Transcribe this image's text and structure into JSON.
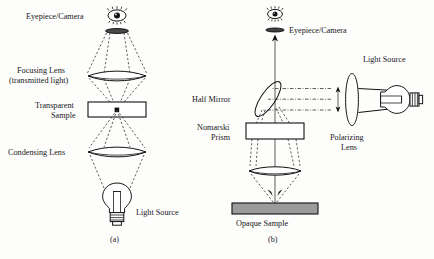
{
  "figure": {
    "panels": [
      {
        "id": "a",
        "caption": "(a)",
        "name": "transmitted-light-microscope",
        "labels": {
          "eyepiece": "Eyepiece/Camera",
          "focusing_lens_line1": "Focusing Lens",
          "focusing_lens_line2": "(transmitted light)",
          "sample_line1": "Transparent",
          "sample_line2": "Sample",
          "condensing_lens": "Condensing Lens",
          "light_source": "Light Source"
        }
      },
      {
        "id": "b",
        "caption": "(b)",
        "name": "nomarski-reflected-light-microscope",
        "labels": {
          "eyepiece": "Eyepiece/Camera",
          "half_mirror": "Half Mirror",
          "prism_line1": "Nomarski",
          "prism_line2": "Prism",
          "polarizing_lens_line1": "Polarizing",
          "polarizing_lens_line2": "Lens",
          "light_source": "Light Source",
          "opaque_sample": "Opaque Sample"
        }
      }
    ],
    "icons": {
      "eye": "eye-icon",
      "bulb": "light-bulb-icon",
      "lens": "lens-icon",
      "prism": "prism-icon",
      "mirror": "half-mirror-icon",
      "arrow_up": "arrow-up-icon",
      "arrow_double": "double-arrow-icon"
    },
    "colors": {
      "ink": "#111111",
      "paper": "#fdfdfc",
      "opaque_sample_fill": "#9b9b9b",
      "ray": "#2a2a2a"
    }
  }
}
